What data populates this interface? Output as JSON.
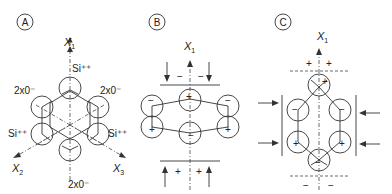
{
  "panels": [
    {
      "id": "A",
      "badge": "A",
      "axes": {
        "x1": "X",
        "x1_sub": "1",
        "x2": "X",
        "x2_sub": "2",
        "x3": "X",
        "x3_sub": "3"
      },
      "labels": {
        "si_top": "Si⁺⁺",
        "si_left": "Si⁺⁺",
        "si_right": "Si⁺⁺",
        "o_upper_left": "2x0⁻",
        "o_upper_right": "2x0⁻",
        "o_bottom": "2x0⁻"
      }
    },
    {
      "id": "B",
      "badge": "B",
      "axes": {
        "x1": "X",
        "x1_sub": "1"
      },
      "top_signs": [
        "−",
        "−"
      ],
      "bottom_signs": [
        "+",
        "+"
      ],
      "atom_signs": {
        "top": "+",
        "upper_left": "−",
        "upper_right": "−",
        "lower_left": "+",
        "lower_right": "+",
        "bottom": "−"
      }
    },
    {
      "id": "C",
      "badge": "C",
      "axes": {
        "x1": "X",
        "x1_sub": "1"
      },
      "top_signs": [
        "+",
        "+"
      ],
      "bottom_signs": [
        "−",
        "−"
      ],
      "atom_signs": {
        "top": "+",
        "upper_left": "−",
        "upper_right": "−",
        "lower_left": "+",
        "lower_right": "+",
        "bottom": "−"
      }
    }
  ]
}
